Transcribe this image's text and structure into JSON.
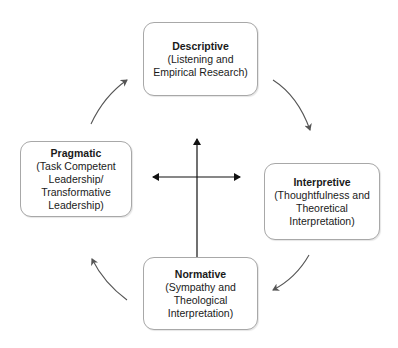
{
  "diagram": {
    "type": "cycle",
    "nodes": [
      {
        "id": "descriptive",
        "title": "Descriptive",
        "description": "(Listening and\nEmpirical Research)"
      },
      {
        "id": "interpretive",
        "title": "Interpretive",
        "description": "(Thoughtfulness and\nTheoretical\nInterpretation)"
      },
      {
        "id": "normative",
        "title": "Normative",
        "description": "(Sympathy and\nTheological\nInterpretation)"
      },
      {
        "id": "pragmatic",
        "title": "Pragmatic",
        "description": "(Task Competent\nLeadership/\nTransformative\nLeadership)"
      }
    ],
    "edges": [
      {
        "from": "descriptive",
        "to": "interpretive",
        "style": "curved-arrow"
      },
      {
        "from": "interpretive",
        "to": "normative",
        "style": "curved-arrow"
      },
      {
        "from": "normative",
        "to": "pragmatic",
        "style": "curved-arrow"
      },
      {
        "from": "pragmatic",
        "to": "descriptive",
        "style": "curved-arrow"
      }
    ],
    "center": {
      "shape": "four-way-cross-arrow"
    }
  },
  "colors": {
    "border": "#a8a8a8",
    "arrow": "#555555",
    "cross": "#111111",
    "text": "#1a1a1a",
    "background": "#ffffff"
  }
}
